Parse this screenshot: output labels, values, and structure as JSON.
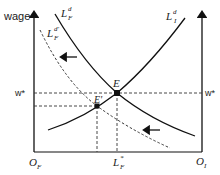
{
  "diagram": {
    "title": "",
    "y_axis_label": "wage",
    "left_origin": {
      "main": "O",
      "sub": "F"
    },
    "right_origin": {
      "main": "O",
      "sub": "I"
    },
    "equilibrium_wage_left": "w*",
    "equilibrium_wage_right": "w*",
    "equilibrium_quantity": {
      "main": "L",
      "sup": "*",
      "sub": "F"
    },
    "points": [
      {
        "id": "E",
        "label": "E"
      },
      {
        "id": "E-prime",
        "label": "E'"
      }
    ],
    "curves": [
      {
        "id": "formal-labor-demand",
        "main": "L",
        "sup": "d",
        "sub": "F",
        "style": "solid"
      },
      {
        "id": "informal-labor-demand",
        "main": "L",
        "sup": "d",
        "sub": "I",
        "style": "solid"
      },
      {
        "id": "formal-labor-demand-shifted",
        "main": "L",
        "sup": "d'",
        "sub": "F",
        "style": "dashed"
      }
    ],
    "shift_arrows": [
      {
        "direction": "left",
        "position": "upper"
      },
      {
        "direction": "left",
        "position": "lower"
      }
    ],
    "colors": {
      "line": "#1a1a1a",
      "dashed": "#333333",
      "background": "#ffffff"
    }
  }
}
